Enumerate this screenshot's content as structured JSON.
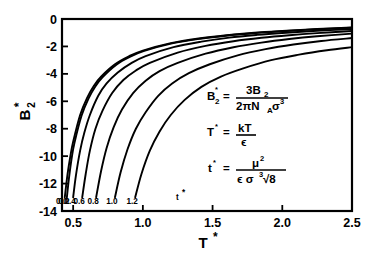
{
  "chart_data": {
    "type": "line",
    "title": "",
    "xlabel": "T*",
    "ylabel": "B2*",
    "xlim": [
      0.42,
      2.5
    ],
    "ylim": [
      -14,
      0
    ],
    "grid": false,
    "legend_position": "inline-curve-labels",
    "legend_title": "t*",
    "xticks": [
      0.5,
      1.0,
      1.5,
      2.0,
      2.5
    ],
    "xticklabels": [
      "0.5",
      "1.0",
      "1.5",
      "2.0",
      "2.5"
    ],
    "yticks": [
      0,
      -2,
      -4,
      -6,
      -8,
      -10,
      -12,
      -14
    ],
    "yticklabels": [
      "0",
      "-2",
      "-4",
      "-6",
      "-8",
      "-10",
      "-12",
      "-14"
    ],
    "series": [
      {
        "name": "0.0",
        "label": "0.0",
        "x": [
          0.44,
          0.46,
          0.48,
          0.5,
          0.55,
          0.6,
          0.65,
          0.7,
          0.8,
          0.9,
          1.0,
          1.2,
          1.4,
          1.6,
          1.8,
          2.0,
          2.25,
          2.5
        ],
        "values": [
          -13.0,
          -11.3,
          -10.0,
          -8.95,
          -7.0,
          -5.75,
          -4.85,
          -4.2,
          -3.3,
          -2.72,
          -2.3,
          -1.76,
          -1.42,
          -1.18,
          -1.0,
          -0.87,
          -0.73,
          -0.62
        ]
      },
      {
        "name": "0.2",
        "label": "0.2",
        "x": [
          0.455,
          0.47,
          0.49,
          0.51,
          0.56,
          0.61,
          0.66,
          0.71,
          0.81,
          0.91,
          1.01,
          1.21,
          1.41,
          1.61,
          1.81,
          2.0,
          2.25,
          2.5
        ],
        "values": [
          -13.0,
          -11.6,
          -10.1,
          -9.0,
          -7.05,
          -5.8,
          -4.9,
          -4.25,
          -3.33,
          -2.75,
          -2.33,
          -1.78,
          -1.44,
          -1.2,
          -1.02,
          -0.89,
          -0.75,
          -0.64
        ]
      },
      {
        "name": "0.4",
        "label": "0.4",
        "x": [
          0.5,
          0.52,
          0.55,
          0.58,
          0.62,
          0.68,
          0.74,
          0.82,
          0.92,
          1.02,
          1.22,
          1.42,
          1.62,
          1.82,
          2.0,
          2.25,
          2.5
        ],
        "values": [
          -13.0,
          -11.4,
          -9.6,
          -8.3,
          -7.0,
          -5.6,
          -4.7,
          -3.9,
          -3.2,
          -2.7,
          -2.05,
          -1.65,
          -1.36,
          -1.16,
          -1.02,
          -0.86,
          -0.74
        ]
      },
      {
        "name": "0.6",
        "label": "0.6",
        "x": [
          0.565,
          0.59,
          0.62,
          0.66,
          0.71,
          0.78,
          0.86,
          0.95,
          1.05,
          1.25,
          1.45,
          1.65,
          1.85,
          2.05,
          2.25,
          2.5
        ],
        "values": [
          -13.0,
          -11.3,
          -9.6,
          -8.0,
          -6.7,
          -5.4,
          -4.45,
          -3.75,
          -3.2,
          -2.45,
          -1.96,
          -1.62,
          -1.37,
          -1.18,
          -1.03,
          -0.88
        ]
      },
      {
        "name": "0.8",
        "label": "0.8",
        "x": [
          0.665,
          0.7,
          0.74,
          0.79,
          0.85,
          0.93,
          1.02,
          1.12,
          1.25,
          1.45,
          1.65,
          1.85,
          2.05,
          2.25,
          2.5
        ],
        "values": [
          -13.0,
          -11.1,
          -9.4,
          -7.9,
          -6.6,
          -5.4,
          -4.5,
          -3.8,
          -3.2,
          -2.53,
          -2.06,
          -1.72,
          -1.46,
          -1.26,
          -1.07
        ]
      },
      {
        "name": "1.0",
        "label": "1.0",
        "x": [
          0.8,
          0.84,
          0.89,
          0.95,
          1.02,
          1.11,
          1.21,
          1.33,
          1.48,
          1.68,
          1.88,
          2.08,
          2.28,
          2.5
        ],
        "values": [
          -13.0,
          -11.2,
          -9.5,
          -8.0,
          -6.8,
          -5.6,
          -4.7,
          -3.95,
          -3.3,
          -2.65,
          -2.2,
          -1.86,
          -1.6,
          -1.39
        ]
      },
      {
        "name": "1.2",
        "label": "1.2",
        "x": [
          0.945,
          0.99,
          1.05,
          1.12,
          1.2,
          1.3,
          1.42,
          1.56,
          1.72,
          1.92,
          2.12,
          2.32,
          2.5
        ],
        "values": [
          -13.0,
          -11.3,
          -9.6,
          -8.2,
          -7.0,
          -5.9,
          -4.95,
          -4.2,
          -3.6,
          -3.0,
          -2.6,
          -2.28,
          -2.05
        ]
      }
    ]
  },
  "axes": {
    "ylabel_base": "B",
    "ylabel_sub": "2",
    "ylabel_star": "*",
    "xlabel_base": "T",
    "xlabel_star": "*"
  },
  "curve_legend": {
    "marker_label": "t",
    "marker_star": "*",
    "labels": [
      "0.0",
      "0.2",
      "0.4",
      "0.6",
      "0.8",
      "1.0",
      "1.2"
    ]
  },
  "equations": [
    {
      "id": "b2-reduced",
      "lhs_base": "B",
      "lhs_sub": "2",
      "lhs_star": "*",
      "equals": "=",
      "numerator": "3B",
      "numerator_sub": "2",
      "denominator_pre": "2πN",
      "denominator_sub": "A",
      "denominator_post": "σ",
      "denominator_sup": "3"
    },
    {
      "id": "t-reduced",
      "lhs_base": "T",
      "lhs_star": "*",
      "equals": "=",
      "numerator": "kT",
      "denominator": "ϵ"
    },
    {
      "id": "dipole-reduced",
      "lhs_base": "t",
      "lhs_star": "*",
      "equals": "=",
      "numerator": "μ",
      "numerator_sup": "2",
      "denominator_pre": "ϵ σ",
      "denominator_sup": "3",
      "denominator_root": "√8"
    }
  ],
  "colors": {
    "ink": "#000000",
    "background": "#ffffff"
  }
}
